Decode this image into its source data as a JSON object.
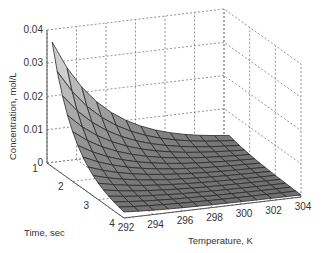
{
  "chart_data": {
    "type": "surface3d",
    "title": "",
    "xlabel": "Temperature, K",
    "ylabel": "Time, sec",
    "zlabel": "Concentration, mol/L",
    "x_ticks": [
      "292",
      "294",
      "296",
      "298",
      "300",
      "302",
      "304"
    ],
    "y_ticks": [
      "1",
      "2",
      "3",
      "4"
    ],
    "z_ticks": [
      "0",
      "0.01",
      "0.02",
      "0.03",
      "0.04"
    ],
    "xlim": [
      292,
      304
    ],
    "ylim": [
      1,
      4
    ],
    "zlim": [
      0,
      0.04
    ],
    "grid": true,
    "colormap": "gray",
    "temperature": [
      292,
      293,
      294,
      295,
      296,
      297,
      298,
      299,
      300,
      301,
      302,
      303,
      304
    ],
    "time": [
      1.2,
      1.4,
      1.6,
      1.8,
      2.0,
      2.2,
      2.4,
      2.6,
      2.8,
      3.0,
      3.2,
      3.4,
      3.6,
      3.8,
      4.0
    ],
    "surface_model": "C = 0.036 * exp(-0.26*(T-292)) * exp(-1.2*(t-1.2)) + 0.0015*exp(-0.35*(t-1.2))",
    "peak": {
      "temperature": 292,
      "time": 1.2,
      "concentration": 0.036
    }
  }
}
